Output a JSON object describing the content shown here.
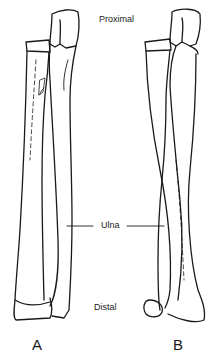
{
  "labels": {
    "proximal": "Proximal",
    "distal": "Distal",
    "ulna": "Ulna",
    "panel_a": "A",
    "panel_b": "B"
  },
  "colors": {
    "line": "#1a1a1a",
    "background": "#ffffff"
  }
}
